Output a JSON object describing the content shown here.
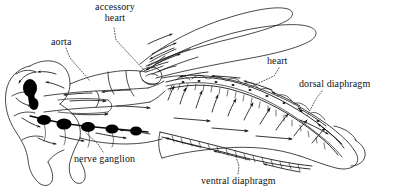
{
  "figure": {
    "ink_color": "#1a1a1a",
    "background_color": "#ffffff",
    "organ_fill_color": "#000000",
    "leader_line_style": "dotted"
  },
  "labels": {
    "accessory_heart": "accessory\nheart",
    "accessory_heart_line1": "accessory",
    "accessory_heart_line2": "heart",
    "aorta": "aorta",
    "heart": "heart",
    "dorsal_diaphragm": "dorsal diaphragm",
    "nerve_ganglion": "nerve ganglion",
    "ventral_diaphragm": "ventral diaphragm"
  }
}
